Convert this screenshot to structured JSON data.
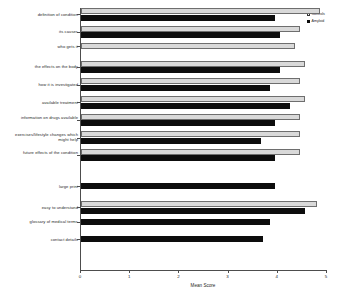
{
  "chart_data": {
    "type": "bar",
    "orientation": "horizontal",
    "title": "",
    "xlabel": "Mean Score",
    "ylabel": "",
    "xlim": [
      0,
      5
    ],
    "xticks": [
      "0",
      "1",
      "2",
      "3",
      "4",
      "5"
    ],
    "grid": false,
    "legend_position": "top-right",
    "categories": [
      "definition of condition",
      "its causes",
      "who gets it",
      "the effects on the body",
      "how it is investigated",
      "available treatment",
      "information on drugs available",
      "exercises/lifestyle changes which might help",
      "future effects of the condition",
      "large print",
      "easy to understand",
      "glossary of medical terms",
      "contact details"
    ],
    "series": [
      {
        "name": "Controls",
        "color": "#d9d9d9",
        "values": [
          4.85,
          4.45,
          4.35,
          4.55,
          4.45,
          4.55,
          4.45,
          4.45,
          4.45,
          null,
          4.8,
          null,
          null
        ]
      },
      {
        "name": "Amyloid",
        "color": "#0d0d0d",
        "values": [
          3.95,
          4.05,
          null,
          4.05,
          3.85,
          4.25,
          3.95,
          3.65,
          3.95,
          3.95,
          4.55,
          3.85,
          3.7
        ]
      }
    ]
  },
  "legend": {
    "items": [
      {
        "label": "Controls"
      },
      {
        "label": "Amyloid"
      }
    ]
  },
  "axis": {
    "x_title": "Mean Score"
  }
}
